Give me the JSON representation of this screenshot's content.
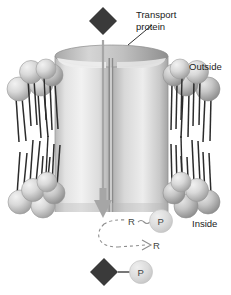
{
  "figure": {
    "width": 231,
    "height": 295
  },
  "labels": {
    "transport_protein": "Transport\nprotein",
    "transport_protein_line1": "Transport",
    "transport_protein_line2": "protein",
    "outside": "Outside",
    "inside": "Inside"
  },
  "molecules": {
    "solute_shape": "diamond",
    "solute_top_label": "",
    "solute_bottom_label": "",
    "phosphate_label": "P",
    "receptor_label": "R",
    "receptor_phosphate_label": "R",
    "receptor_free_label": "R"
  },
  "reaction": {
    "bound_receptor": "R",
    "bound_phosphate": "P",
    "released_receptor": "R",
    "carrier_phosphate": "P"
  },
  "colors": {
    "solute_dark": "#3a3a3a",
    "phosphate_fill": "#d8d8d8",
    "protein_light": "#e8e8e8",
    "protein_mid": "#c4c4c4",
    "head_fill": "#cfcfcf",
    "tail_stroke": "#2b2b2b",
    "arrow_gray": "#9a9a9a",
    "text": "#1a1a1a",
    "background": "#ffffff"
  },
  "counts": {
    "upper_left_heads": 5,
    "upper_right_heads": 5,
    "lower_left_heads": 5,
    "lower_right_heads": 5
  }
}
